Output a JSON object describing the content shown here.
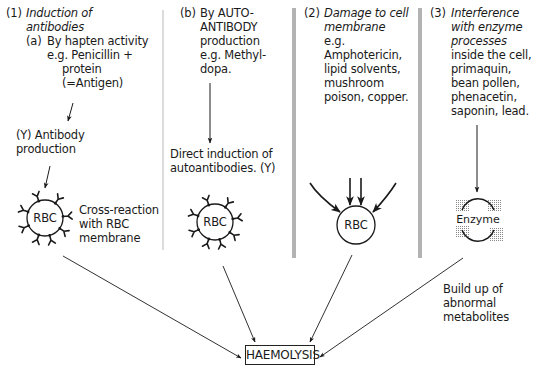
{
  "diagram": {
    "columns": [
      {
        "number": "(1)",
        "heading": [
          "Induction of",
          "antibodies"
        ],
        "sub": {
          "number": "(a)",
          "lines": [
            "By hapten activity",
            "e.g. Penicillin +",
            "protein",
            "(=Antigen)"
          ]
        },
        "step": [
          "(Υ) Antibody",
          "production"
        ],
        "cell_label": "RBC",
        "cell_note": [
          "Cross-reaction",
          "with RBC",
          "membrane"
        ]
      },
      {
        "number": "(b)",
        "lines": [
          "By AUTO-",
          "ANTIBODY",
          "production",
          "e.g. Methyl-",
          "dopa."
        ],
        "step": [
          "Direct induction of",
          "autoantibodies. (Υ)"
        ],
        "cell_label": "RBC"
      },
      {
        "number": "(2)",
        "heading": [
          "Damage to cell",
          "membrane"
        ],
        "lines": [
          "e.g.",
          "Amphotericin,",
          "lipid solvents,",
          "mushroom",
          "poison, copper."
        ],
        "cell_label": "RBC"
      },
      {
        "number": "(3)",
        "heading": [
          "Interference",
          "with enzyme",
          "processes"
        ],
        "lines": [
          "inside the cell,",
          "primaquin,",
          "bean pollen,",
          "phenacetin,",
          "saponin, lead."
        ],
        "cell_label": "Enzyme",
        "result": [
          "Build up of",
          "abnormal",
          "metabolites"
        ]
      }
    ],
    "outcome": "HAEMOLYSIS",
    "colors": {
      "ink": "#1a1a1a",
      "divider_gray": "#b3b3b3",
      "enzyme_dots": "#9a9a9a"
    }
  }
}
